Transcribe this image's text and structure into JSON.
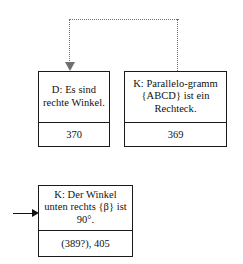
{
  "diagram": {
    "type": "node-link-graph",
    "background_color": "#ffffff",
    "border_color": "#1a1a1a",
    "connector_color": "#6f6f6f",
    "arrow_color": "#111111",
    "nodes": [
      {
        "key": "left",
        "label": "D: Es sind rechte Winkel.",
        "id": "370"
      },
      {
        "key": "right",
        "label": "K: Parallelo-gramm {ABCD} ist ein Rechteck.",
        "id": "369"
      },
      {
        "key": "bottom",
        "label": "K: Der Winkel unten rechts {β} ist 90°.",
        "id": "(389?), 405"
      }
    ],
    "connectors": [
      {
        "key": "dotted-bracket",
        "style": "dotted",
        "from": "right",
        "to": "left",
        "arrowhead": "down"
      },
      {
        "key": "incoming-arrow",
        "style": "solid",
        "to": "bottom",
        "arrowhead": "right"
      }
    ]
  }
}
